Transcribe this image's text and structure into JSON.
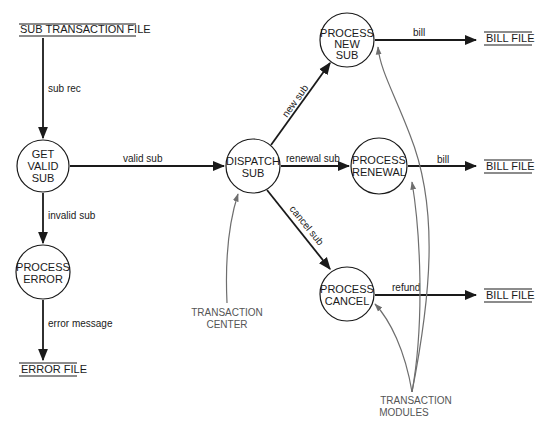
{
  "colors": {
    "ink": "#1a1a1a",
    "control": "#6e6e6e",
    "control_text": "#555555",
    "background": "#ffffff"
  },
  "stores": {
    "sub_transaction_file": "SUB TRANSACTION FILE",
    "error_file": "ERROR FILE",
    "bill_file_new": "BILL FILE",
    "bill_file_renewal": "BILL FILE",
    "bill_file_cancel": "BILL FILE"
  },
  "processes": {
    "get_valid_sub": [
      "GET",
      "VALID",
      "SUB"
    ],
    "process_error": [
      "PROCESS",
      "ERROR"
    ],
    "dispatch_sub": [
      "DISPATCH",
      "SUB"
    ],
    "process_new_sub": [
      "PROCESS",
      "NEW",
      "SUB"
    ],
    "process_renewal": [
      "PROCESS",
      "RENEWAL"
    ],
    "process_cancel": [
      "PROCESS",
      "CANCEL"
    ]
  },
  "flows": {
    "sub_rec": "sub rec",
    "valid_sub": "valid sub",
    "invalid_sub": "invalid sub",
    "error_message": "error message",
    "new_sub": "new sub",
    "renewal_sub": "renewal sub",
    "cancel_sub": "cancel sub",
    "bill_new": "bill",
    "bill_renewal": "bill",
    "refund": "refund"
  },
  "annotations": {
    "transaction_center": [
      "TRANSACTION",
      "CENTER"
    ],
    "transaction_modules": [
      "TRANSACTION",
      "MODULES"
    ]
  }
}
